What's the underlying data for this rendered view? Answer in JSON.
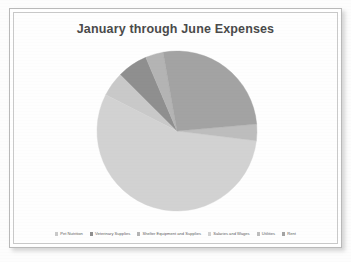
{
  "chart_data": {
    "type": "pie",
    "title": "January through June Expenses",
    "xlabel": "",
    "ylabel": "",
    "legend_position": "bottom",
    "grid": false,
    "categories": [
      "Pet Nutrition",
      "Veterinary Supplies",
      "Shelter Equipment and Supplies",
      "Salaries and Wages",
      "Utilities",
      "Rent"
    ],
    "values": [
      5,
      6,
      3.5,
      55.5,
      3.5,
      22
    ],
    "colors": [
      "#c9c9c9",
      "#8f8f8f",
      "#b4b4b4",
      "#d2d2d2",
      "#bdbdbd",
      "#a3a3a3"
    ],
    "slices": [
      {
        "label": "Pet Nutrition",
        "value": 5,
        "color": "#c9c9c9",
        "start_angle": 297,
        "end_angle": 315
      },
      {
        "label": "Veterinary Supplies",
        "value": 6,
        "color": "#8f8f8f",
        "start_angle": 315,
        "end_angle": 337
      },
      {
        "label": "Shelter Equipment and Supplies",
        "value": 3.5,
        "color": "#b4b4b4",
        "start_angle": 337,
        "end_angle": 350
      },
      {
        "label": "Salaries and Wages",
        "value": 55.5,
        "color": "#d2d2d2",
        "start_angle": 97,
        "end_angle": 297
      },
      {
        "label": "Utilities",
        "value": 3.5,
        "color": "#bdbdbd",
        "start_angle": 85,
        "end_angle": 97
      },
      {
        "label": "Rent",
        "value": 22,
        "color": "#a3a3a3",
        "start_angle": 350,
        "end_angle": 85
      }
    ]
  },
  "legend": {
    "items": [
      {
        "label": "Pet Nutrition",
        "color": "#c9c9c9"
      },
      {
        "label": "Veterinary Supplies",
        "color": "#8f8f8f"
      },
      {
        "label": "Shelter Equipment and Supplies",
        "color": "#b4b4b4"
      },
      {
        "label": "Salaries and Wages",
        "color": "#d2d2d2"
      },
      {
        "label": "Utilities",
        "color": "#bdbdbd"
      },
      {
        "label": "Rent",
        "color": "#a3a3a3"
      }
    ]
  },
  "theme": {
    "title_color": "#4a4a4a",
    "legend_text_color": "#5d5d5d",
    "frame_color": "#b9b9b9",
    "background": "#ffffff"
  }
}
